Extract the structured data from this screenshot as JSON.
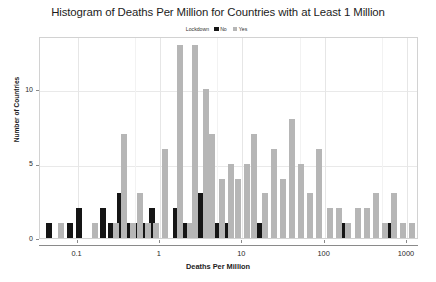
{
  "chart_data": {
    "type": "bar",
    "title": "Histogram of Deaths Per Million for Countries with at Least 1 Million",
    "xlabel": "Deaths Per Million",
    "ylabel": "Number of Countries",
    "xscale": "log",
    "xlim": [
      0.035,
      1400
    ],
    "ylim": [
      0,
      13.6
    ],
    "grid": true,
    "legend": {
      "title": "Lockdown",
      "position": "top-center",
      "entries": [
        {
          "label": "No",
          "color": "#151515"
        },
        {
          "label": "Yes",
          "color": "#b6b6b6"
        }
      ]
    },
    "xticks": [
      {
        "value": 0.1,
        "label": "0.1"
      },
      {
        "value": 1,
        "label": "1"
      },
      {
        "value": 10,
        "label": "10"
      },
      {
        "value": 100,
        "label": "100"
      },
      {
        "value": 1000,
        "label": "1000"
      }
    ],
    "yticks": [
      {
        "value": 0,
        "label": "0"
      },
      {
        "value": 5,
        "label": "5"
      },
      {
        "value": 10,
        "label": "10"
      }
    ],
    "series": [
      {
        "name": "No",
        "color": "#151515",
        "bars": [
          {
            "xcenter": 0.045,
            "value": 1
          },
          {
            "xcenter": 0.082,
            "value": 1
          },
          {
            "xcenter": 0.105,
            "value": 2
          },
          {
            "xcenter": 0.205,
            "value": 2
          },
          {
            "xcenter": 0.255,
            "value": 1
          },
          {
            "xcenter": 0.33,
            "value": 3
          },
          {
            "xcenter": 0.42,
            "value": 1
          },
          {
            "xcenter": 0.52,
            "value": 1
          },
          {
            "xcenter": 0.64,
            "value": 1
          },
          {
            "xcenter": 0.81,
            "value": 2
          },
          {
            "xcenter": 1.55,
            "value": 2
          },
          {
            "xcenter": 2.05,
            "value": 1
          },
          {
            "xcenter": 3.1,
            "value": 3
          },
          {
            "xcenter": 5.1,
            "value": 1
          },
          {
            "xcenter": 6.4,
            "value": 1
          },
          {
            "xcenter": 16.5,
            "value": 1
          },
          {
            "xcenter": 52.0,
            "value": 1
          },
          {
            "xcenter": 165.0,
            "value": 1
          },
          {
            "xcenter": 640.0,
            "value": 1
          }
        ]
      },
      {
        "name": "Yes",
        "color": "#b6b6b6",
        "bars": [
          {
            "xcenter": 0.063,
            "value": 1
          },
          {
            "xcenter": 0.165,
            "value": 1
          },
          {
            "xcenter": 0.29,
            "value": 1
          },
          {
            "xcenter": 0.37,
            "value": 7
          },
          {
            "xcenter": 0.465,
            "value": 1
          },
          {
            "xcenter": 0.58,
            "value": 3
          },
          {
            "xcenter": 0.72,
            "value": 1
          },
          {
            "xcenter": 0.9,
            "value": 1
          },
          {
            "xcenter": 1.15,
            "value": 6
          },
          {
            "xcenter": 1.75,
            "value": 13
          },
          {
            "xcenter": 2.3,
            "value": 1
          },
          {
            "xcenter": 2.7,
            "value": 13
          },
          {
            "xcenter": 3.6,
            "value": 10
          },
          {
            "xcenter": 4.3,
            "value": 7
          },
          {
            "xcenter": 5.7,
            "value": 4
          },
          {
            "xcenter": 7.2,
            "value": 5
          },
          {
            "xcenter": 9.0,
            "value": 4
          },
          {
            "xcenter": 11.5,
            "value": 5
          },
          {
            "xcenter": 14.0,
            "value": 7
          },
          {
            "xcenter": 19.0,
            "value": 3
          },
          {
            "xcenter": 24.0,
            "value": 6
          },
          {
            "xcenter": 31.0,
            "value": 4
          },
          {
            "xcenter": 40.0,
            "value": 8
          },
          {
            "xcenter": 52.0,
            "value": 5
          },
          {
            "xcenter": 67.0,
            "value": 3
          },
          {
            "xcenter": 85.0,
            "value": 6
          },
          {
            "xcenter": 115.0,
            "value": 2
          },
          {
            "xcenter": 150.0,
            "value": 2
          },
          {
            "xcenter": 195.0,
            "value": 1
          },
          {
            "xcenter": 255.0,
            "value": 2
          },
          {
            "xcenter": 330.0,
            "value": 2
          },
          {
            "xcenter": 420.0,
            "value": 3
          },
          {
            "xcenter": 540.0,
            "value": 1
          },
          {
            "xcenter": 700.0,
            "value": 3
          },
          {
            "xcenter": 900.0,
            "value": 1
          },
          {
            "xcenter": 1150.0,
            "value": 1
          }
        ]
      }
    ]
  }
}
